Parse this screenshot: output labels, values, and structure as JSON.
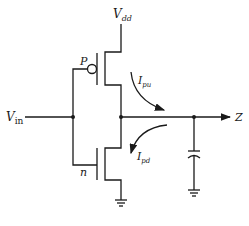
{
  "diagram": {
    "type": "CMOS inverter circuit",
    "labels": {
      "supply": "V",
      "supply_sub": "dd",
      "input": "V",
      "input_sub": "in",
      "output": "Z",
      "pmos": "P",
      "nmos": "n",
      "pullup_current": "I",
      "pullup_current_sub": "pu",
      "pulldown_current": "I",
      "pulldown_current_sub": "pd"
    },
    "components": [
      "pmos-transistor",
      "nmos-transistor",
      "load-capacitor",
      "ground",
      "ground"
    ],
    "colors": {
      "line": "#1a1a1a",
      "background": "#ffffff"
    }
  }
}
